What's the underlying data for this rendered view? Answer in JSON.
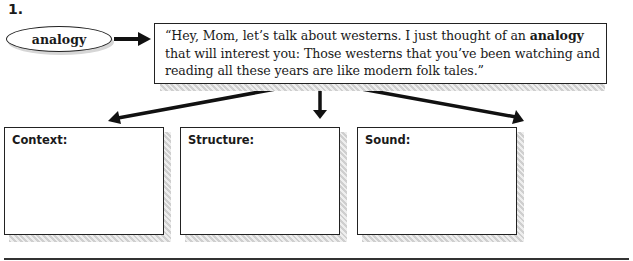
{
  "item_number": "1.",
  "term": {
    "label": "analogy"
  },
  "quote": {
    "before": "“Hey, Mom, let’s talk about westerns. I just thought of an ",
    "bold": "analogy",
    "after": " that will interest you: Those westerns that you’ve been watching and reading all these years are like modern folk tales.”"
  },
  "boxes": [
    {
      "label": "Context:",
      "value": ""
    },
    {
      "label": "Structure:",
      "value": ""
    },
    {
      "label": "Sound:",
      "value": ""
    }
  ],
  "colors": {
    "ink": "#1a1a1a",
    "shadow": "#cfcfcf",
    "background": "#ffffff"
  }
}
